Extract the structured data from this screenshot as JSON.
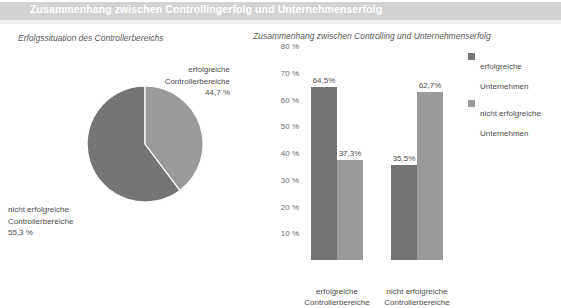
{
  "header": {
    "title": "Zusammenhang zwischen Controllingerfolg und Unternehmenserfolg",
    "bar_color": "#d3d3d3",
    "text_color": "#ffffff"
  },
  "colors": {
    "series_dark": "#757575",
    "series_light": "#9a9a9a",
    "text": "#4d4d4d",
    "background": "#ffffff"
  },
  "pie_panel": {
    "subtitle": "Erfolgssituation des Controllerbereichs",
    "labels": {
      "success": "erfolgreiche\nControllerbereiche\n44,7 %",
      "success_line1": "erfolgreiche",
      "success_line2": "Controllerbereiche",
      "success_value": "44,7 %",
      "nosuccess_line1": "nicht erfolgreiche",
      "nosuccess_line2": "Controllerbereiche",
      "nosuccess_value": "55,3 %"
    }
  },
  "bar_panel": {
    "subtitle": "Zusammenhang zwischen Controlling und Unternehmenserfolg",
    "legend": [
      {
        "label_line1": "erfolgreiche",
        "label_line2": "Unternehmen",
        "color": "#757575"
      },
      {
        "label_line1": "nicht erfolgreiche",
        "label_line2": "Unternehmen",
        "color": "#9a9a9a"
      }
    ],
    "categories": [
      {
        "line1": "erfolgreiche",
        "line2": "Controllerbereiche"
      },
      {
        "line1": "nicht erfolgreiche",
        "line2": "Controllerbereiche"
      }
    ]
  },
  "chart_data": [
    {
      "type": "pie",
      "title": "Erfolgssituation des Controllerbereichs",
      "labels": [
        "nicht erfolgreiche Controllerbereiche",
        "erfolgreiche Controllerbereiche"
      ],
      "values": [
        55.3,
        44.7
      ],
      "value_labels": [
        "55,3 %",
        "44,7 %"
      ],
      "colors": [
        "#757575",
        "#9a9a9a"
      ],
      "unit": "%",
      "legend": "outside-labels"
    },
    {
      "type": "bar",
      "title": "Zusammenhang zwischen Controlling und Unternehmenserfolg",
      "categories": [
        "erfolgreiche Controllerbereiche",
        "nicht erfolgreiche Controllerbereiche"
      ],
      "series": [
        {
          "name": "erfolgreiche Unternehmen",
          "color": "#757575",
          "values": [
            64.5,
            35.5
          ],
          "value_labels": [
            "64,5%",
            "35,5%"
          ]
        },
        {
          "name": "nicht erfolgreiche Unternehmen",
          "color": "#9a9a9a",
          "values": [
            37.3,
            62.7
          ],
          "value_labels": [
            "37,3%",
            "62,7%"
          ]
        }
      ],
      "xlabel": "",
      "ylabel": "",
      "ylim": [
        0,
        80
      ],
      "yticks": [
        10,
        20,
        30,
        40,
        50,
        60,
        70,
        80
      ],
      "ytick_labels": [
        "10 %",
        "20 %",
        "30 %",
        "40 %",
        "50 %",
        "60 %",
        "70 %",
        "80 %"
      ],
      "grid": false,
      "legend_position": "top-right"
    }
  ]
}
